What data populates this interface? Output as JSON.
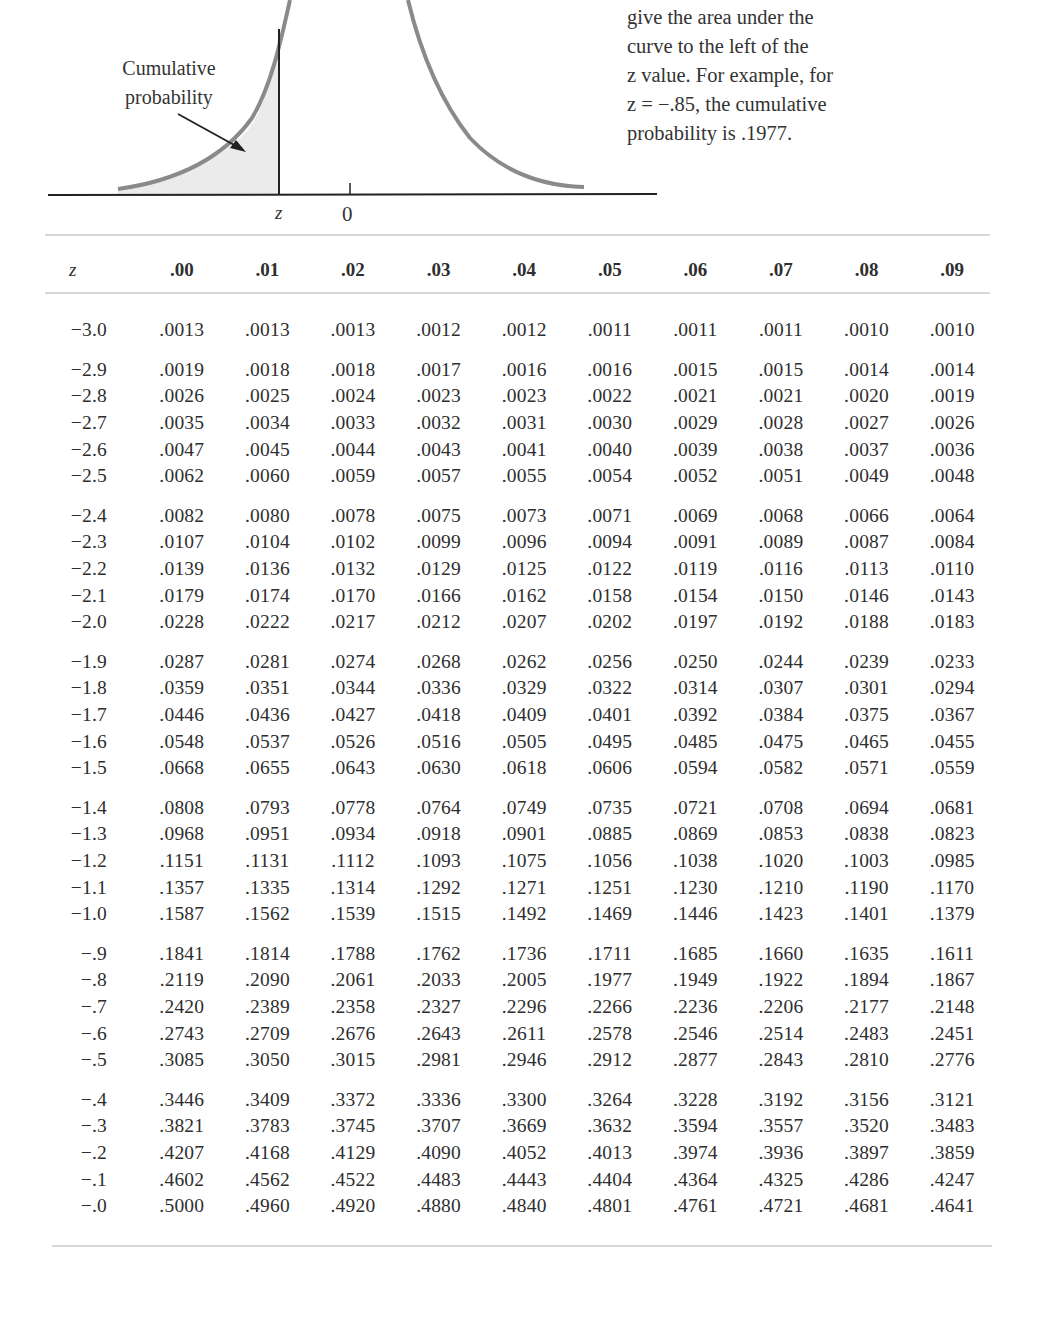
{
  "figure": {
    "label_cumulative": [
      "Cumulative",
      "probability"
    ],
    "axis_z": "z",
    "axis_zero": "0",
    "curve_color": "#8a8a8a",
    "shade_color": "#ebebeb"
  },
  "caption": {
    "lines": [
      "give the area under the",
      "curve to the left of the",
      "z value. For example, for",
      "z = −.85, the cumulative",
      "probability is .1977."
    ]
  },
  "chart_data": {
    "type": "table",
    "columns": [
      "z",
      ".00",
      ".01",
      ".02",
      ".03",
      ".04",
      ".05",
      ".06",
      ".07",
      ".08",
      ".09"
    ],
    "rows": [
      {
        "z": "−3.0",
        "v": [
          ".0013",
          ".0013",
          ".0013",
          ".0012",
          ".0012",
          ".0011",
          ".0011",
          ".0011",
          ".0010",
          ".0010"
        ],
        "group_start": true
      },
      {
        "z": "−2.9",
        "v": [
          ".0019",
          ".0018",
          ".0018",
          ".0017",
          ".0016",
          ".0016",
          ".0015",
          ".0015",
          ".0014",
          ".0014"
        ],
        "group_start": true
      },
      {
        "z": "−2.8",
        "v": [
          ".0026",
          ".0025",
          ".0024",
          ".0023",
          ".0023",
          ".0022",
          ".0021",
          ".0021",
          ".0020",
          ".0019"
        ]
      },
      {
        "z": "−2.7",
        "v": [
          ".0035",
          ".0034",
          ".0033",
          ".0032",
          ".0031",
          ".0030",
          ".0029",
          ".0028",
          ".0027",
          ".0026"
        ]
      },
      {
        "z": "−2.6",
        "v": [
          ".0047",
          ".0045",
          ".0044",
          ".0043",
          ".0041",
          ".0040",
          ".0039",
          ".0038",
          ".0037",
          ".0036"
        ]
      },
      {
        "z": "−2.5",
        "v": [
          ".0062",
          ".0060",
          ".0059",
          ".0057",
          ".0055",
          ".0054",
          ".0052",
          ".0051",
          ".0049",
          ".0048"
        ]
      },
      {
        "z": "−2.4",
        "v": [
          ".0082",
          ".0080",
          ".0078",
          ".0075",
          ".0073",
          ".0071",
          ".0069",
          ".0068",
          ".0066",
          ".0064"
        ],
        "group_start": true
      },
      {
        "z": "−2.3",
        "v": [
          ".0107",
          ".0104",
          ".0102",
          ".0099",
          ".0096",
          ".0094",
          ".0091",
          ".0089",
          ".0087",
          ".0084"
        ]
      },
      {
        "z": "−2.2",
        "v": [
          ".0139",
          ".0136",
          ".0132",
          ".0129",
          ".0125",
          ".0122",
          ".0119",
          ".0116",
          ".0113",
          ".0110"
        ]
      },
      {
        "z": "−2.1",
        "v": [
          ".0179",
          ".0174",
          ".0170",
          ".0166",
          ".0162",
          ".0158",
          ".0154",
          ".0150",
          ".0146",
          ".0143"
        ]
      },
      {
        "z": "−2.0",
        "v": [
          ".0228",
          ".0222",
          ".0217",
          ".0212",
          ".0207",
          ".0202",
          ".0197",
          ".0192",
          ".0188",
          ".0183"
        ]
      },
      {
        "z": "−1.9",
        "v": [
          ".0287",
          ".0281",
          ".0274",
          ".0268",
          ".0262",
          ".0256",
          ".0250",
          ".0244",
          ".0239",
          ".0233"
        ],
        "group_start": true
      },
      {
        "z": "−1.8",
        "v": [
          ".0359",
          ".0351",
          ".0344",
          ".0336",
          ".0329",
          ".0322",
          ".0314",
          ".0307",
          ".0301",
          ".0294"
        ]
      },
      {
        "z": "−1.7",
        "v": [
          ".0446",
          ".0436",
          ".0427",
          ".0418",
          ".0409",
          ".0401",
          ".0392",
          ".0384",
          ".0375",
          ".0367"
        ]
      },
      {
        "z": "−1.6",
        "v": [
          ".0548",
          ".0537",
          ".0526",
          ".0516",
          ".0505",
          ".0495",
          ".0485",
          ".0475",
          ".0465",
          ".0455"
        ]
      },
      {
        "z": "−1.5",
        "v": [
          ".0668",
          ".0655",
          ".0643",
          ".0630",
          ".0618",
          ".0606",
          ".0594",
          ".0582",
          ".0571",
          ".0559"
        ]
      },
      {
        "z": "−1.4",
        "v": [
          ".0808",
          ".0793",
          ".0778",
          ".0764",
          ".0749",
          ".0735",
          ".0721",
          ".0708",
          ".0694",
          ".0681"
        ],
        "group_start": true
      },
      {
        "z": "−1.3",
        "v": [
          ".0968",
          ".0951",
          ".0934",
          ".0918",
          ".0901",
          ".0885",
          ".0869",
          ".0853",
          ".0838",
          ".0823"
        ]
      },
      {
        "z": "−1.2",
        "v": [
          ".1151",
          ".1131",
          ".1112",
          ".1093",
          ".1075",
          ".1056",
          ".1038",
          ".1020",
          ".1003",
          ".0985"
        ]
      },
      {
        "z": "−1.1",
        "v": [
          ".1357",
          ".1335",
          ".1314",
          ".1292",
          ".1271",
          ".1251",
          ".1230",
          ".1210",
          ".1190",
          ".1170"
        ]
      },
      {
        "z": "−1.0",
        "v": [
          ".1587",
          ".1562",
          ".1539",
          ".1515",
          ".1492",
          ".1469",
          ".1446",
          ".1423",
          ".1401",
          ".1379"
        ]
      },
      {
        "z": "−.9",
        "v": [
          ".1841",
          ".1814",
          ".1788",
          ".1762",
          ".1736",
          ".1711",
          ".1685",
          ".1660",
          ".1635",
          ".1611"
        ],
        "group_start": true
      },
      {
        "z": "−.8",
        "v": [
          ".2119",
          ".2090",
          ".2061",
          ".2033",
          ".2005",
          ".1977",
          ".1949",
          ".1922",
          ".1894",
          ".1867"
        ]
      },
      {
        "z": "−.7",
        "v": [
          ".2420",
          ".2389",
          ".2358",
          ".2327",
          ".2296",
          ".2266",
          ".2236",
          ".2206",
          ".2177",
          ".2148"
        ]
      },
      {
        "z": "−.6",
        "v": [
          ".2743",
          ".2709",
          ".2676",
          ".2643",
          ".2611",
          ".2578",
          ".2546",
          ".2514",
          ".2483",
          ".2451"
        ]
      },
      {
        "z": "−.5",
        "v": [
          ".3085",
          ".3050",
          ".3015",
          ".2981",
          ".2946",
          ".2912",
          ".2877",
          ".2843",
          ".2810",
          ".2776"
        ]
      },
      {
        "z": "−.4",
        "v": [
          ".3446",
          ".3409",
          ".3372",
          ".3336",
          ".3300",
          ".3264",
          ".3228",
          ".3192",
          ".3156",
          ".3121"
        ],
        "group_start": true
      },
      {
        "z": "−.3",
        "v": [
          ".3821",
          ".3783",
          ".3745",
          ".3707",
          ".3669",
          ".3632",
          ".3594",
          ".3557",
          ".3520",
          ".3483"
        ]
      },
      {
        "z": "−.2",
        "v": [
          ".4207",
          ".4168",
          ".4129",
          ".4090",
          ".4052",
          ".4013",
          ".3974",
          ".3936",
          ".3897",
          ".3859"
        ]
      },
      {
        "z": "−.1",
        "v": [
          ".4602",
          ".4562",
          ".4522",
          ".4483",
          ".4443",
          ".4404",
          ".4364",
          ".4325",
          ".4286",
          ".4247"
        ]
      },
      {
        "z": "−.0",
        "v": [
          ".5000",
          ".4960",
          ".4920",
          ".4880",
          ".4840",
          ".4801",
          ".4761",
          ".4721",
          ".4681",
          ".4641"
        ]
      }
    ]
  }
}
